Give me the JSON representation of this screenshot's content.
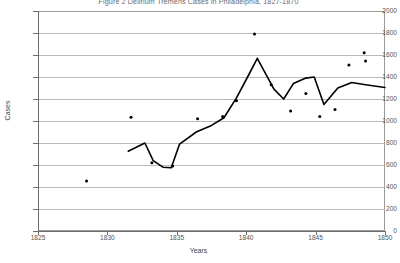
{
  "chart_data": {
    "type": "line",
    "title": "Figure 2  Delirium Tremens Cases in Philadelphia, 1827-1870",
    "xlabel": "Years",
    "ylabel": "Cases",
    "xlim": [
      1825,
      1850
    ],
    "ylim": [
      0,
      2000
    ],
    "grid": true,
    "legend": "none",
    "xticks": [
      1825,
      1830,
      1835,
      1840,
      1845,
      1850
    ],
    "xtick_labels": [
      "1825",
      "1830",
      "1835",
      "1840",
      "1845",
      "1850"
    ],
    "yticks": [
      0,
      200,
      400,
      600,
      800,
      1000,
      1200,
      1400,
      1600,
      1800,
      2000
    ],
    "ytick_labels": [
      "0",
      "200",
      "400",
      "600",
      "800",
      "1000",
      "1200",
      "1400",
      "1600",
      "1800",
      "2000"
    ],
    "series": [
      {
        "name": "Delirium tremens cases (trend line)",
        "type": "line",
        "color": "#000000",
        "x": [
          1831.5,
          1832.7,
          1833.3,
          1834.0,
          1834.6,
          1835.2,
          1836.4,
          1837.5,
          1838.4,
          1839.3,
          1840.1,
          1840.8,
          1842.0,
          1842.7,
          1843.4,
          1844.3,
          1844.9,
          1845.6,
          1846.6,
          1847.6,
          1848.6,
          1850.0
        ],
        "values": [
          725,
          800,
          640,
          580,
          575,
          790,
          900,
          960,
          1030,
          1210,
          1400,
          1570,
          1290,
          1200,
          1340,
          1390,
          1400,
          1150,
          1300,
          1350,
          1330,
          1305
        ]
      },
      {
        "name": "Delirium tremens cases (observations)",
        "type": "scatter",
        "color": "#000000",
        "x": [
          1828.5,
          1831.7,
          1833.2,
          1834.7,
          1836.5,
          1838.3,
          1839.3,
          1840.6,
          1841.8,
          1843.2,
          1844.3,
          1845.3,
          1846.4,
          1847.4,
          1848.5,
          1848.6
        ],
        "values": [
          455,
          1035,
          620,
          590,
          1020,
          1040,
          1185,
          1790,
          1330,
          1090,
          1250,
          1040,
          1105,
          1510,
          1620,
          1545
        ]
      }
    ],
    "geometry": {
      "plot_left": 38,
      "plot_top": 11,
      "plot_width": 347,
      "plot_height": 220
    }
  }
}
